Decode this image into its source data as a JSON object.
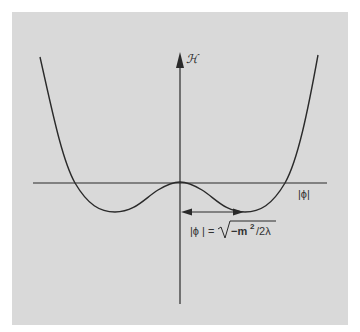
{
  "diagram": {
    "type": "potential-curve",
    "y_axis_label": "ℋ",
    "x_axis_label": "|ϕ|",
    "annotation": {
      "lhs": "|ϕ | =",
      "radicand": "−m",
      "exponent": "2",
      "rest": "/2λ"
    },
    "colors": {
      "background": "#d9d9d9",
      "frame": "#ffffff",
      "ink": "#2a2a2a"
    }
  }
}
